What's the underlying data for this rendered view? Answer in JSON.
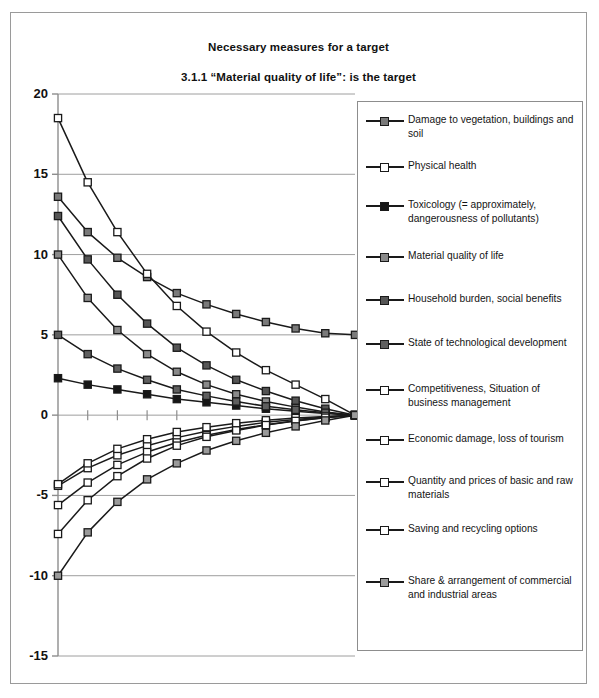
{
  "chart_data": {
    "type": "line",
    "title": "Necessary measures for a target",
    "subtitle": "3.1.1 “Material quality of life”: is the target",
    "xlabel": "",
    "ylabel": "",
    "ylim": [
      -15,
      20
    ],
    "yticks": [
      20,
      15,
      10,
      5,
      0,
      -5,
      -10,
      -15
    ],
    "ytick_labels": [
      "20",
      "15",
      "10",
      "5",
      "0",
      "-5",
      "-10",
      "-15"
    ],
    "grid": true,
    "legend_position": "right",
    "x": [
      0,
      1,
      2,
      3,
      4,
      5,
      6,
      7,
      8,
      9,
      10
    ],
    "series": [
      {
        "name": "Damage to vegetation, buildings and soil",
        "marker": "square-gray",
        "fill": "#7a7a7a",
        "values": [
          13.6,
          11.4,
          9.8,
          8.6,
          7.6,
          6.9,
          6.3,
          5.8,
          5.4,
          5.1,
          5.0
        ]
      },
      {
        "name": "Physical health",
        "marker": "square-open",
        "fill": "#ffffff",
        "values": [
          18.5,
          14.5,
          11.4,
          8.8,
          6.8,
          5.2,
          3.9,
          2.8,
          1.9,
          1.0,
          0.0
        ]
      },
      {
        "name": "Toxicology (= approximately, dangerousness of pollutants)",
        "marker": "square-black",
        "fill": "#161616",
        "values": [
          2.3,
          1.9,
          1.6,
          1.3,
          1.0,
          0.8,
          0.6,
          0.4,
          0.25,
          0.1,
          0.0
        ]
      },
      {
        "name": "Material quality of life",
        "marker": "square-gray",
        "fill": "#8a8a8a",
        "values": [
          10.0,
          7.3,
          5.3,
          3.8,
          2.7,
          1.9,
          1.3,
          0.85,
          0.5,
          0.2,
          0.0
        ]
      },
      {
        "name": "Household burden, social benefits",
        "marker": "square-darkgray",
        "fill": "#555555",
        "values": [
          12.4,
          9.7,
          7.5,
          5.7,
          4.2,
          3.1,
          2.2,
          1.5,
          0.9,
          0.4,
          0.0
        ]
      },
      {
        "name": "State of technological development",
        "marker": "square-darkgray",
        "fill": "#5f5f5f",
        "values": [
          5.0,
          3.8,
          2.9,
          2.2,
          1.6,
          1.2,
          0.85,
          0.55,
          0.33,
          0.15,
          0.0
        ]
      },
      {
        "name": "Competitiveness, Situation of business management",
        "marker": "square-open",
        "fill": "#ffffff",
        "values": [
          -4.4,
          -3.3,
          -2.5,
          -1.9,
          -1.4,
          -1.0,
          -0.7,
          -0.45,
          -0.27,
          -0.12,
          0.0
        ]
      },
      {
        "name": "Economic damage, loss of tourism",
        "marker": "square-open",
        "fill": "#ffffff",
        "values": [
          -5.6,
          -4.2,
          -3.1,
          -2.3,
          -1.7,
          -1.25,
          -0.9,
          -0.6,
          -0.35,
          -0.15,
          0.0
        ]
      },
      {
        "name": "Quantity and prices of basic and raw materials",
        "marker": "square-open",
        "fill": "#ffffff",
        "values": [
          -4.3,
          -3.0,
          -2.1,
          -1.5,
          -1.05,
          -0.75,
          -0.5,
          -0.32,
          -0.18,
          -0.08,
          0.0
        ]
      },
      {
        "name": "Saving and recycling options",
        "marker": "square-open",
        "fill": "#ffffff",
        "values": [
          -7.4,
          -5.3,
          -3.8,
          -2.7,
          -1.9,
          -1.35,
          -0.95,
          -0.62,
          -0.36,
          -0.16,
          0.0
        ]
      },
      {
        "name": "Share & arrangement of commercial and industrial areas",
        "marker": "square-gray",
        "fill": "#9a9a9a",
        "values": [
          -10.0,
          -7.3,
          -5.4,
          -4.0,
          -3.0,
          -2.2,
          -1.6,
          -1.1,
          -0.7,
          -0.33,
          0.0
        ]
      }
    ]
  },
  "legend": {
    "entries": [
      {
        "label": "Damage to vegetation, buildings and soil",
        "fill": "#7a7a7a"
      },
      {
        "label": "Physical health",
        "fill": "#ffffff"
      },
      {
        "label": "Toxicology (= approximately, dangerousness of pollutants)",
        "fill": "#161616"
      },
      {
        "label": "Material quality of life",
        "fill": "#8a8a8a"
      },
      {
        "label": "Household burden, social benefits",
        "fill": "#555555"
      },
      {
        "label": "State of technological development",
        "fill": "#5f5f5f"
      },
      {
        "label": "Competitiveness, Situation of business management",
        "fill": "#ffffff"
      },
      {
        "label": "Economic damage, loss of tourism",
        "fill": "#ffffff"
      },
      {
        "label": "Quantity and prices of basic and raw materials",
        "fill": "#ffffff"
      },
      {
        "label": "Saving and recycling options",
        "fill": "#ffffff"
      },
      {
        "label": "Share & arrangement of commercial and industrial areas",
        "fill": "#9a9a9a"
      }
    ]
  },
  "colors": {
    "axis": "#8d8d8d",
    "grid": "#9e9e9e",
    "line": "#1a1a1a",
    "frame": "#9a9a9a"
  }
}
